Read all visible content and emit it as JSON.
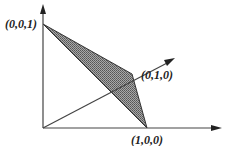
{
  "diagram": {
    "type": "simplex-3d",
    "vertices": [
      {
        "label": "(0,0,1)",
        "x": 43,
        "y": 24
      },
      {
        "label": "(0,1,0)",
        "x": 132,
        "y": 74
      },
      {
        "label": "(1,0,0)",
        "x": 147,
        "y": 128
      }
    ],
    "origin": {
      "x": 43,
      "y": 128
    },
    "colors": {
      "axis": "#333333",
      "fill": "#8a8a8a",
      "edge": "#333333"
    }
  }
}
